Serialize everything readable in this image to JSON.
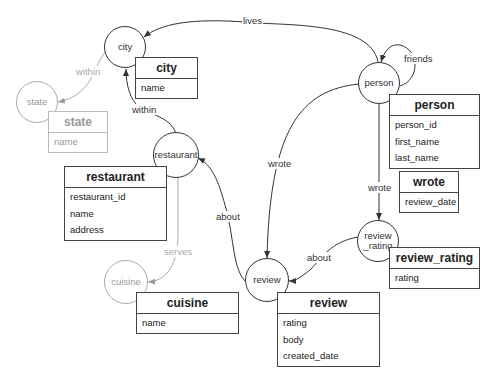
{
  "nodes": {
    "city": {
      "label": "city"
    },
    "state": {
      "label": "state"
    },
    "restaurant": {
      "label": "restaurant"
    },
    "person": {
      "label": "person"
    },
    "review_rating": {
      "label": "review\n_rating",
      "line1": "review",
      "line2": "_rating"
    },
    "cuisine": {
      "label": "cuisine"
    },
    "review": {
      "label": "review"
    }
  },
  "tables": {
    "city": {
      "title": "city",
      "fields": [
        "name"
      ]
    },
    "state": {
      "title": "state",
      "fields": [
        "name"
      ]
    },
    "restaurant": {
      "title": "restaurant",
      "fields": [
        "restaurant_id",
        "name",
        "address"
      ]
    },
    "person": {
      "title": "person",
      "fields": [
        "person_id",
        "first_name",
        "last_name"
      ]
    },
    "wrote": {
      "title": "wrote",
      "fields": [
        "review_date"
      ]
    },
    "review_rating": {
      "title": "review_rating",
      "fields": [
        "rating"
      ]
    },
    "cuisine": {
      "title": "cuisine",
      "fields": [
        "name"
      ]
    },
    "review": {
      "title": "review",
      "fields": [
        "rating",
        "body",
        "created_date"
      ]
    }
  },
  "edges": {
    "lives": {
      "label": "lives",
      "from": "person",
      "to": "city"
    },
    "friends": {
      "label": "friends",
      "from": "person",
      "to": "person"
    },
    "city_within": {
      "label": "within",
      "from": "city",
      "to": "state"
    },
    "restaurant_within": {
      "label": "within",
      "from": "restaurant",
      "to": "city"
    },
    "person_wrote_review": {
      "label": "wrote",
      "from": "person",
      "to": "review"
    },
    "person_wrote_rating": {
      "label": "wrote",
      "from": "person",
      "to": "review_rating"
    },
    "review_about": {
      "label": "about",
      "from": "review",
      "to": "restaurant"
    },
    "rating_about": {
      "label": "about",
      "from": "review_rating",
      "to": "review"
    },
    "serves": {
      "label": "serves",
      "from": "restaurant",
      "to": "cuisine"
    }
  },
  "colors": {
    "dark": "#333333",
    "light": "#aaaaaa",
    "background": "#ffffff"
  }
}
